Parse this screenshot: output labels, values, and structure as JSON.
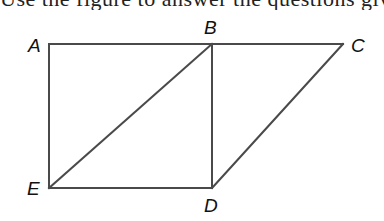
{
  "header": {
    "cropped_text": "Use the figure to answer the questions given below"
  },
  "diagram": {
    "type": "geometry-figure",
    "stroke_color": "#4a4a4a",
    "points": [
      {
        "id": "A",
        "label": "A",
        "x": 49,
        "y": 44,
        "label_x": 28,
        "label_y": 52
      },
      {
        "id": "B",
        "label": "B",
        "x": 212,
        "y": 44,
        "label_x": 204,
        "label_y": 34
      },
      {
        "id": "C",
        "label": "C",
        "x": 343,
        "y": 44,
        "label_x": 351,
        "label_y": 52
      },
      {
        "id": "D",
        "label": "D",
        "x": 212,
        "y": 188,
        "label_x": 204,
        "label_y": 212
      },
      {
        "id": "E",
        "label": "E",
        "x": 49,
        "y": 188,
        "label_x": 27,
        "label_y": 195
      }
    ],
    "segments": [
      {
        "from": "A",
        "to": "B"
      },
      {
        "from": "B",
        "to": "C"
      },
      {
        "from": "A",
        "to": "E"
      },
      {
        "from": "E",
        "to": "D"
      },
      {
        "from": "B",
        "to": "D"
      },
      {
        "from": "E",
        "to": "B"
      },
      {
        "from": "C",
        "to": "D"
      }
    ]
  }
}
